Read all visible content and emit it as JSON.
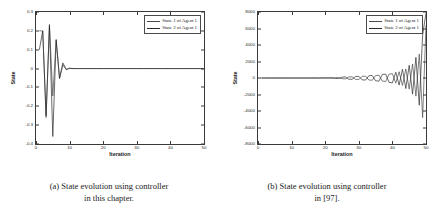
{
  "figure": {
    "panels": [
      {
        "id": "panel-a",
        "caption_line1": "(a) State evolution using controller",
        "caption_line2": "in this chapter.",
        "chart_data": {
          "type": "line",
          "title": "",
          "xlabel": "Iteration",
          "ylabel": "State",
          "xlim": [
            0,
            50
          ],
          "ylim": [
            -0.4,
            0.3
          ],
          "xticks": [
            0,
            10,
            20,
            30,
            40,
            50
          ],
          "xticklabels": [
            "0",
            "10",
            "20",
            "30",
            "40",
            "50"
          ],
          "yticks": [
            0.3,
            0.2,
            0.1,
            0,
            -0.1,
            -0.2,
            -0.3,
            -0.4
          ],
          "yticklabels": [
            "0.3",
            "0.2",
            "0.1",
            "0",
            "-0.1",
            "-0.2",
            "-0.3",
            "-0.4"
          ],
          "grid": false,
          "legend_position": "upper right",
          "series": [
            {
              "name": "State 1 of Agent 1",
              "color": "#4a4a4a",
              "x": [
                1,
                2,
                3,
                4,
                5,
                6,
                7,
                8,
                9,
                10,
                11,
                12,
                13,
                14,
                15,
                20,
                25,
                30,
                35,
                40,
                45,
                50
              ],
              "values": [
                0.2,
                0.2,
                -0.26,
                0.234,
                -0.145,
                0.155,
                -0.055,
                0.02,
                -0.006,
                0.002,
                0.0,
                0.0,
                0.0,
                0.0,
                0.0,
                0.0,
                0.0,
                0.0,
                0.0,
                0.0,
                0.0,
                0.0
              ]
            },
            {
              "name": "State 2 of Agent 1",
              "color": "#2b2b2b",
              "x": [
                1,
                2,
                3,
                4,
                5,
                6,
                7,
                8,
                9,
                10,
                11,
                12,
                13,
                14,
                15,
                20,
                25,
                30,
                35,
                40,
                45,
                50
              ],
              "values": [
                0.1,
                0.2,
                -0.25,
                0.23,
                -0.36,
                0.15,
                -0.05,
                0.03,
                -0.004,
                0.001,
                0.0,
                0.0,
                0.0,
                0.0,
                0.0,
                0.0,
                0.0,
                0.0,
                0.0,
                0.0,
                0.0,
                0.0
              ]
            }
          ],
          "legend": [
            "State 1 of Agent 1",
            "State 2 of Agent 1"
          ]
        }
      },
      {
        "id": "panel-b",
        "caption_line1": "(b) State evolution using controller",
        "caption_line2": "in [97].",
        "chart_data": {
          "type": "line",
          "title": "",
          "xlabel": "Iteration",
          "ylabel": "State",
          "xlim": [
            0,
            50
          ],
          "ylim": [
            -8000,
            8000
          ],
          "xticks": [
            0,
            10,
            20,
            30,
            40,
            50
          ],
          "xticklabels": [
            "0",
            "10",
            "20",
            "30",
            "40",
            "50"
          ],
          "yticks": [
            8000,
            6000,
            4000,
            2000,
            0,
            -2000,
            -4000,
            -6000,
            -8000
          ],
          "yticklabels": [
            "8000",
            "6000",
            "4000",
            "2000",
            "0",
            "-2000",
            "-4000",
            "-6000",
            "-8000"
          ],
          "grid": false,
          "legend_position": "upper right",
          "series": [
            {
              "name": "State 1 of Agent 1",
              "color": "#4a4a4a",
              "x": [
                1,
                5,
                10,
                15,
                20,
                22,
                24,
                26,
                28,
                30,
                32,
                34,
                36,
                38,
                40,
                41,
                42,
                43,
                44,
                45,
                46,
                47,
                48,
                49,
                50
              ],
              "values": [
                0,
                0,
                0,
                0,
                10,
                -20,
                60,
                -110,
                140,
                -180,
                220,
                -270,
                330,
                -420,
                520,
                -620,
                760,
                -900,
                1100,
                -1350,
                1700,
                -2200,
                2900,
                -4800,
                6400
              ]
            },
            {
              "name": "State 2 of Agent 1",
              "color": "#2b2b2b",
              "x": [
                1,
                5,
                10,
                15,
                20,
                22,
                24,
                26,
                28,
                30,
                32,
                34,
                36,
                38,
                40,
                41,
                42,
                43,
                44,
                45,
                46,
                47,
                48,
                49,
                50
              ],
              "values": [
                0,
                0,
                0,
                0,
                -10,
                25,
                -70,
                130,
                -160,
                200,
                -250,
                300,
                -380,
                470,
                -590,
                700,
                -860,
                1050,
                -1280,
                1550,
                -1950,
                2500,
                -3300,
                5200,
                7900
              ]
            }
          ],
          "legend": [
            "State 1 of Agent 1",
            "State 2 of Agent 1"
          ]
        }
      }
    ]
  }
}
